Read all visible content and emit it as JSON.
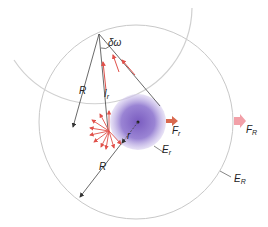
{
  "labels": {
    "delta_omega": "δω",
    "R_top": "R",
    "I_r_main": "I",
    "I_r_sub": "r",
    "r": "r",
    "R_bottom": "R",
    "F_r_main": "F",
    "F_r_sub": "r",
    "F_R_main": "F",
    "F_R_sub": "R",
    "E_r_main": "E",
    "E_r_sub": "r",
    "E_R_main": "E",
    "E_R_sub": "R"
  },
  "colors": {
    "circle_stroke": "#c8c8c8",
    "line": "#444444",
    "ray": "#e0504a",
    "sphere": "#8a70c8",
    "arrow_small": "#d9694f",
    "arrow_large": "#f2a0a8"
  }
}
